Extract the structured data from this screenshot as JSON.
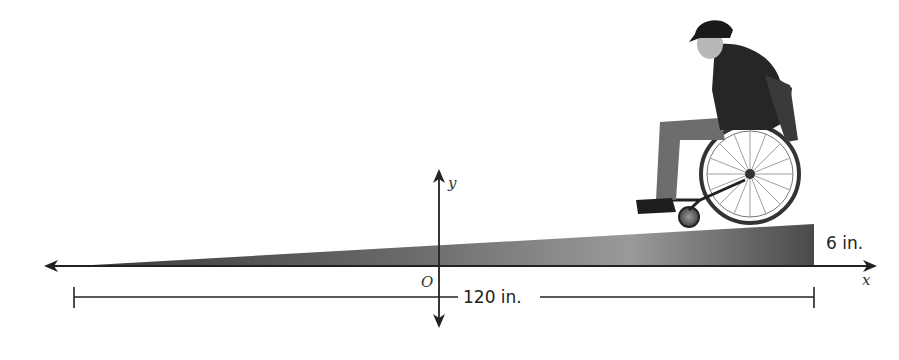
{
  "diagram": {
    "axes": {
      "x_label": "x",
      "y_label": "y",
      "origin_label": "O"
    },
    "dimensions": {
      "horizontal_run": "120 in.",
      "vertical_rise": "6 in."
    },
    "figure": {
      "subject": "person in wheelchair descending ramp",
      "ramp_color": "#555555"
    }
  }
}
